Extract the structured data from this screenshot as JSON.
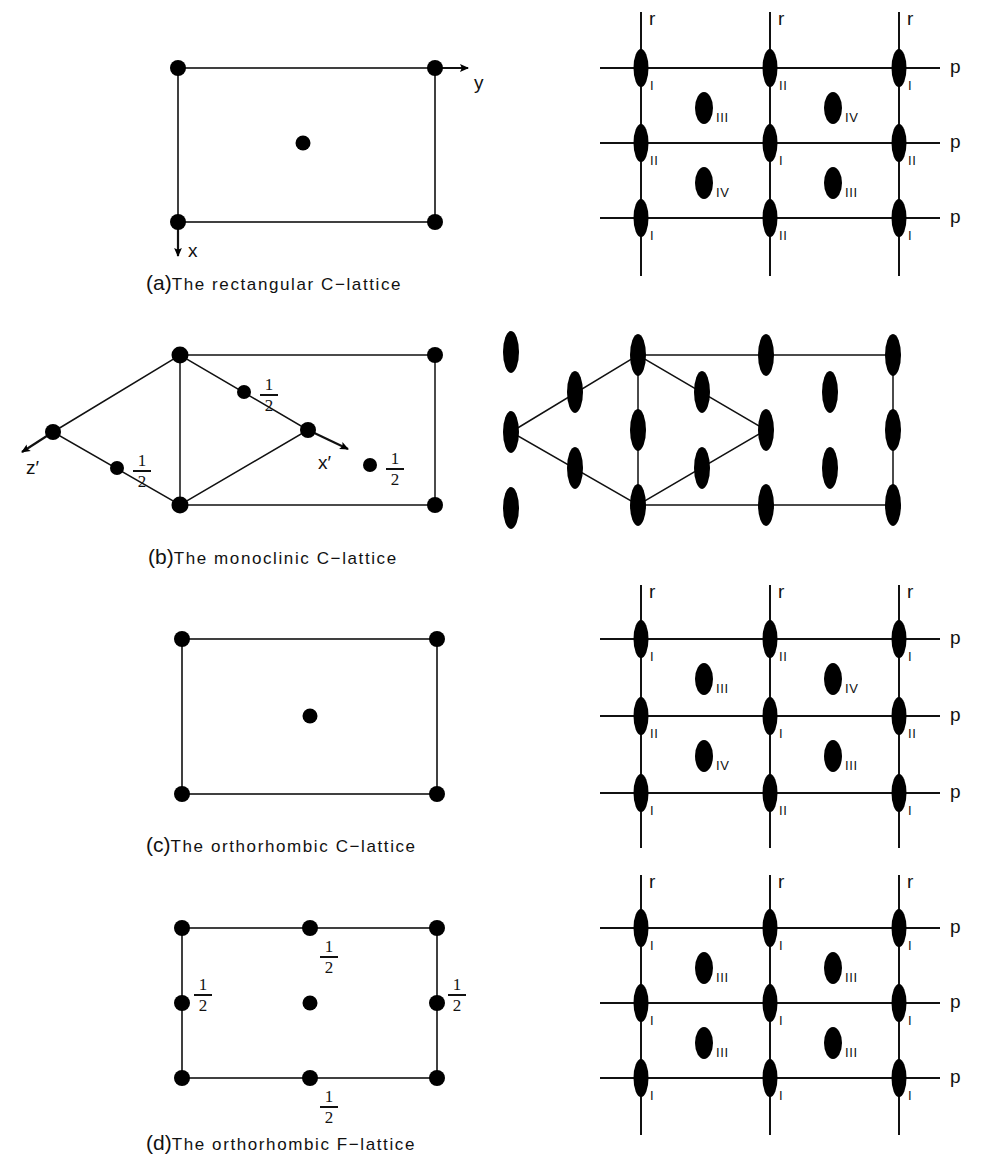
{
  "figure": {
    "background": "#ffffff",
    "ink": "#000000",
    "width": 985,
    "height": 1166
  },
  "captions": {
    "a": {
      "index": "(a)",
      "text": "The rectangular C−lattice",
      "big_token": "C−lattice"
    },
    "b": {
      "index": "(b)",
      "text": "The monoclinic C−lattice",
      "big_token": "C−lattice"
    },
    "c": {
      "index": "(c)",
      "text": "The orthorhombic C−lattice",
      "big_token": "C−lattice"
    },
    "d": {
      "index": "(d)",
      "text": "The orthorhombic F−lattice",
      "big_token": "F−lattice"
    }
  },
  "panel_a": {
    "left": {
      "axes": [
        {
          "name": "y",
          "label": "y",
          "direction": "right"
        },
        {
          "name": "x",
          "label": "x",
          "direction": "down"
        }
      ],
      "lattice_points": [
        {
          "role": "corner",
          "position": "top-left"
        },
        {
          "role": "corner",
          "position": "top-right"
        },
        {
          "role": "corner",
          "position": "bottom-left"
        },
        {
          "role": "corner",
          "position": "bottom-right"
        },
        {
          "role": "centering",
          "position": "center"
        }
      ]
    },
    "right": {
      "vertical_line_label": "r",
      "horizontal_line_label": "p",
      "node_labels": [
        [
          "I",
          "II",
          "I"
        ],
        [
          "II",
          "I",
          "II"
        ],
        [
          "I",
          "II",
          "I"
        ]
      ],
      "interior_labels": [
        [
          "III",
          "IV"
        ],
        [
          "IV",
          "III"
        ]
      ]
    }
  },
  "panel_b": {
    "left": {
      "axes": [
        {
          "name": "z-prime",
          "label": "z′",
          "direction": "down-left"
        },
        {
          "name": "x-prime",
          "label": "x′",
          "direction": "down-right"
        }
      ],
      "height_labels": [
        "1/2",
        "1/2",
        "1/2"
      ],
      "fraction": {
        "numerator": "1",
        "denominator": "2"
      }
    },
    "right": {
      "description": "same rhombus and rectangle outline with lens-shaped lattice points"
    }
  },
  "panel_c": {
    "left": {
      "lattice_points": [
        {
          "role": "corner",
          "position": "top-left"
        },
        {
          "role": "corner",
          "position": "top-right"
        },
        {
          "role": "corner",
          "position": "bottom-left"
        },
        {
          "role": "corner",
          "position": "bottom-right"
        },
        {
          "role": "centering",
          "position": "center"
        }
      ]
    },
    "right": {
      "vertical_line_label": "r",
      "horizontal_line_label": "p",
      "node_labels": [
        [
          "I",
          "II",
          "I"
        ],
        [
          "II",
          "I",
          "II"
        ],
        [
          "I",
          "II",
          "I"
        ]
      ],
      "interior_labels": [
        [
          "III",
          "IV"
        ],
        [
          "IV",
          "III"
        ]
      ]
    }
  },
  "panel_d": {
    "left": {
      "height_labels": [
        "1/2",
        "1/2",
        "1/2",
        "1/2"
      ],
      "fraction": {
        "numerator": "1",
        "denominator": "2"
      },
      "lattice_points": [
        {
          "role": "corner",
          "position": "top-left"
        },
        {
          "role": "edge-center",
          "position": "top-middle",
          "height": "1/2"
        },
        {
          "role": "corner",
          "position": "top-right"
        },
        {
          "role": "edge-center",
          "position": "left-middle",
          "height": "1/2"
        },
        {
          "role": "centering",
          "position": "center"
        },
        {
          "role": "edge-center",
          "position": "right-middle",
          "height": "1/2"
        },
        {
          "role": "corner",
          "position": "bottom-left"
        },
        {
          "role": "edge-center",
          "position": "bottom-middle",
          "height": "1/2"
        },
        {
          "role": "corner",
          "position": "bottom-right"
        }
      ]
    },
    "right": {
      "vertical_line_label": "r",
      "horizontal_line_label": "p",
      "node_labels": [
        [
          "I",
          "I",
          "I"
        ],
        [
          "I",
          "I",
          "I"
        ],
        [
          "I",
          "I",
          "I"
        ]
      ],
      "interior_labels": [
        [
          "III",
          "III"
        ],
        [
          "III",
          "III"
        ]
      ]
    }
  }
}
